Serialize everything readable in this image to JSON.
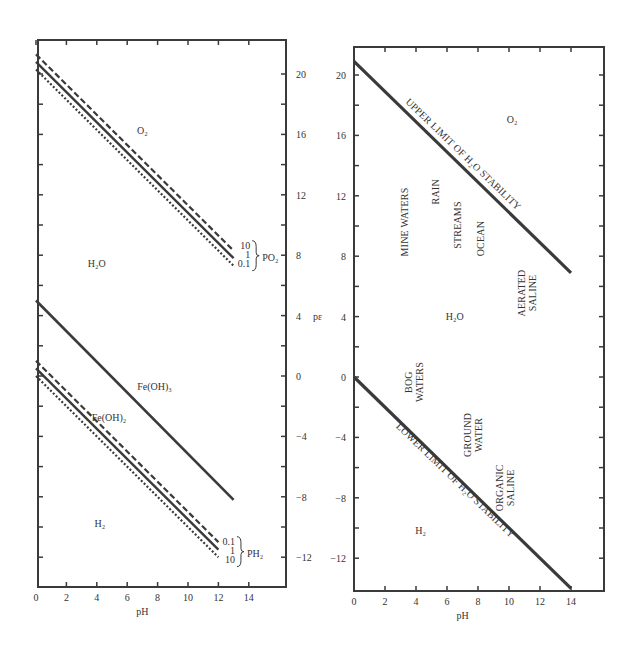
{
  "chart_data": [
    {
      "type": "line",
      "name": "left-panel-pe-ph-iron",
      "title": "",
      "xlabel": "pH",
      "ylabel": "pε",
      "xlim": [
        0,
        16
      ],
      "ylim": [
        -14,
        22
      ],
      "x_ticks": [
        0,
        2,
        4,
        6,
        8,
        10,
        12,
        14
      ],
      "y_ticks_labeled": [
        20,
        16,
        12,
        8,
        4,
        0,
        -4,
        -8,
        -12
      ],
      "y_axis_side": "right",
      "grid": false,
      "frame": {
        "x0": 38,
        "x1": 286,
        "y0": 40,
        "y1": 587
      },
      "scale": {
        "px0": 36,
        "px_per_ph": 15.2,
        "py0": 376,
        "py_per_pe": 15.1
      },
      "series": [
        {
          "name": "O2/H2O PO2=10",
          "style": "dashed",
          "width": 2.2,
          "x": [
            0,
            13
          ],
          "y": [
            21.3,
            8.3
          ]
        },
        {
          "name": "O2/H2O PO2=1",
          "style": "solid",
          "width": 2.4,
          "x": [
            0,
            13
          ],
          "y": [
            20.8,
            7.8
          ]
        },
        {
          "name": "O2/H2O PO2=0.1",
          "style": "dotted",
          "width": 2.2,
          "x": [
            0,
            13
          ],
          "y": [
            20.3,
            7.3
          ]
        },
        {
          "name": "Fe(OH)3",
          "style": "solid",
          "width": 2.6,
          "x": [
            0,
            13
          ],
          "y": [
            5.0,
            -8.2
          ]
        },
        {
          "name": "H2O/H2 PH2=0.1",
          "style": "dashed",
          "width": 2.2,
          "x": [
            0,
            12
          ],
          "y": [
            1.0,
            -11.0
          ]
        },
        {
          "name": "H2O/H2 PH2=1",
          "style": "solid",
          "width": 2.4,
          "x": [
            0,
            12
          ],
          "y": [
            0.5,
            -11.5
          ]
        },
        {
          "name": "H2O/H2 PH2=10",
          "style": "dotted",
          "width": 2.2,
          "x": [
            0,
            12
          ],
          "y": [
            0.0,
            -12.0
          ]
        }
      ],
      "annotations": [
        {
          "text": "O₂",
          "x": 7.0,
          "y": 16.0
        },
        {
          "text": "H₂O",
          "x": 4.0,
          "y": 7.2
        },
        {
          "text": "Fe(OH)₃",
          "x": 7.8,
          "y": -0.9
        },
        {
          "text": "Fe(OH)₂",
          "x": 4.8,
          "y": -3.0
        },
        {
          "text": "H₂",
          "x": 4.2,
          "y": -10.0
        }
      ],
      "legends": [
        {
          "label": "PO₂",
          "entries": [
            "10",
            "1",
            "0.1"
          ],
          "x": 13.3,
          "y": 7.9
        },
        {
          "label": "PH₂",
          "entries": [
            "0.1",
            "1",
            "10"
          ],
          "x": 12.3,
          "y": -11.7
        }
      ]
    },
    {
      "type": "line",
      "name": "right-panel-natural-waters",
      "title": "",
      "xlabel": "pH",
      "ylabel": "pε",
      "xlim": [
        0,
        16
      ],
      "ylim": [
        -14,
        22
      ],
      "x_ticks": [
        0,
        2,
        4,
        6,
        8,
        10,
        12,
        14
      ],
      "y_ticks_labeled": [
        20,
        16,
        12,
        8,
        4,
        0,
        -4,
        -8,
        -12
      ],
      "y_axis_side": "left",
      "grid": false,
      "frame": {
        "x0": 354,
        "x1": 604,
        "y0": 47,
        "y1": 591
      },
      "scale": {
        "px0": 354,
        "px_per_ph": 15.5,
        "py0": 377,
        "py_per_pe": 15.1
      },
      "series": [
        {
          "name": "Upper limit of H2O stability",
          "style": "solid",
          "width": 3.2,
          "x": [
            0,
            14
          ],
          "y": [
            20.9,
            6.9
          ]
        },
        {
          "name": "Lower limit of H2O stability",
          "style": "solid",
          "width": 3.2,
          "x": [
            0,
            14
          ],
          "y": [
            0.0,
            -14.0
          ]
        }
      ],
      "line_labels": [
        {
          "text": "UPPER LIMIT OF H₂O STABILITY",
          "x": 6.9,
          "y": 14.6,
          "angle": 44
        },
        {
          "text": "LOWER LIMIT OF H₂O STABILITY",
          "x": 6.4,
          "y": -7.0,
          "angle": 44
        }
      ],
      "annotations": [
        {
          "text": "O₂",
          "x": 10.2,
          "y": 16.8
        },
        {
          "text": "H₂O",
          "x": 6.5,
          "y": 3.8
        },
        {
          "text": "H₂",
          "x": 4.3,
          "y": -10.4
        }
      ],
      "environments": [
        {
          "lines": [
            "MINE WATERS"
          ],
          "x": 3.5,
          "y": 10.0
        },
        {
          "lines": [
            "RAIN"
          ],
          "x": 5.5,
          "y": 12.0
        },
        {
          "lines": [
            "STREAMS"
          ],
          "x": 6.9,
          "y": 9.8
        },
        {
          "lines": [
            "OCEAN"
          ],
          "x": 8.4,
          "y": 8.9
        },
        {
          "lines": [
            "AERATED",
            "SALINE"
          ],
          "x": 11.4,
          "y": 5.3
        },
        {
          "lines": [
            "BOG",
            "WATERS"
          ],
          "x": 4.1,
          "y": -0.6
        },
        {
          "lines": [
            "GROUND",
            "WATER"
          ],
          "x": 7.9,
          "y": -4.1
        },
        {
          "lines": [
            "ORGANIC",
            "SALINE"
          ],
          "x": 10.0,
          "y": -7.6
        }
      ]
    }
  ],
  "labels": {
    "pe_axis": "pε",
    "ph_axis": "pH"
  },
  "colors": {
    "ink": "#3a3a3a",
    "text": "#333333",
    "background": "#ffffff"
  }
}
